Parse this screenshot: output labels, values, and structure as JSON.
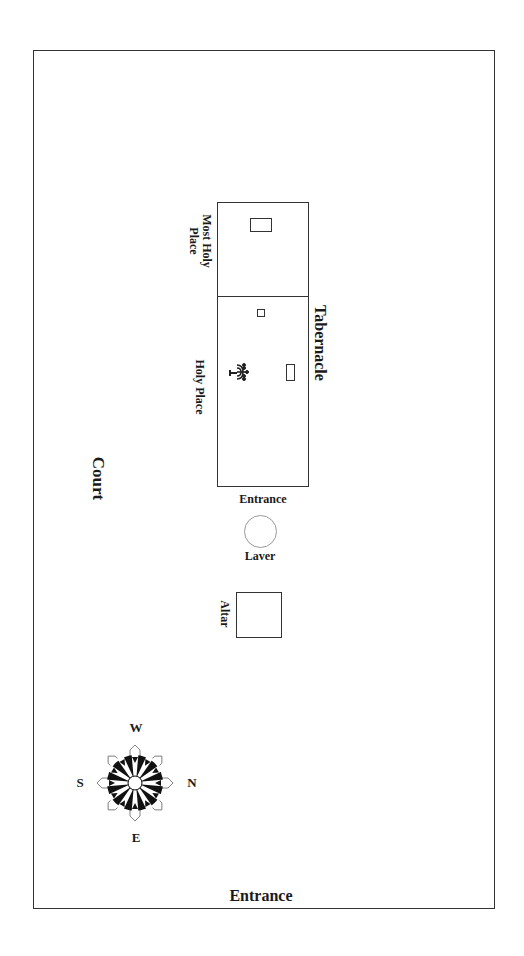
{
  "diagram": {
    "title": "Tabernacle",
    "labels": {
      "court": "Court",
      "tabernacle": "Tabernacle",
      "most_holy_place_line1": "Most Holy",
      "most_holy_place_line2": "Place",
      "holy_place": "Holy Place",
      "tabernacle_entrance": "Entrance",
      "laver": "Laver",
      "altar": "Altar",
      "court_entrance": "Entrance"
    },
    "compass": {
      "top": "W",
      "right": "N",
      "bottom": "E",
      "left": "S"
    },
    "furnishings": [
      {
        "name": "ark",
        "room": "Most Holy Place"
      },
      {
        "name": "altar-of-incense",
        "room": "Holy Place"
      },
      {
        "name": "lampstand",
        "room": "Holy Place"
      },
      {
        "name": "table-of-showbread",
        "room": "Holy Place"
      }
    ],
    "colors": {
      "line": "#333333",
      "text": "#1a1a1a",
      "laver_outline": "#999999",
      "background": "#ffffff"
    }
  }
}
